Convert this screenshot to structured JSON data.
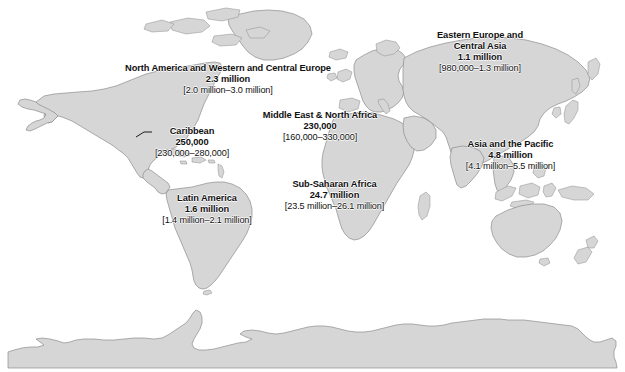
{
  "map": {
    "title": "World map of HIV regional estimates",
    "land_color": "#d6d6d6",
    "coast_color": "#8c8c8c",
    "ocean_color": "#ffffff",
    "text_color": "#111111"
  },
  "regions": [
    {
      "id": "north-america-western-central-europe",
      "name": "North America and Western and Central Europe",
      "value": "2.3 million",
      "range": "[2.0 million–3.0 million]",
      "has_leader_line": false
    },
    {
      "id": "eastern-europe-central-asia",
      "name": "Eastern Europe and\nCentral Asia",
      "name_line1": "Eastern Europe and",
      "name_line2": "Central Asia",
      "value": "1.1 million",
      "range": "[980,000–1.3 million]",
      "has_leader_line": false
    },
    {
      "id": "caribbean",
      "name": "Caribbean",
      "value": "250,000",
      "range": "[230,000–280,000]",
      "has_leader_line": true
    },
    {
      "id": "middle-east-north-africa",
      "name": "Middle East & North Africa",
      "value": "230,000",
      "range": "[160,000–330,000]",
      "has_leader_line": false
    },
    {
      "id": "asia-and-the-pacific",
      "name": "Asia and the Pacific",
      "value": "4.8 million",
      "range": "[4.1 million–5.5 million]",
      "has_leader_line": false
    },
    {
      "id": "sub-saharan-africa",
      "name": "Sub-Saharan Africa",
      "value": "24.7 million",
      "range": "[23.5 million–26.1 million]",
      "has_leader_line": false
    },
    {
      "id": "latin-america",
      "name": "Latin America",
      "value": "1.6 million",
      "range": "[1.4 million–2.1 million]",
      "has_leader_line": false
    }
  ]
}
